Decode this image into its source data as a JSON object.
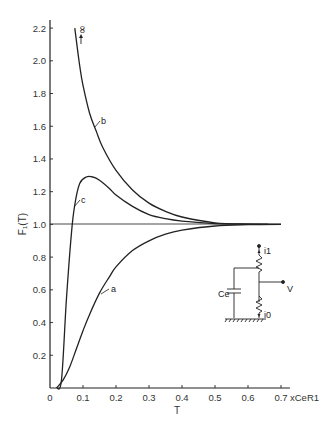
{
  "chart_data": {
    "type": "line",
    "title": "",
    "xlabel": "T",
    "x_unit_label": "x C_e R_1",
    "ylabel": "F₁(T)",
    "xlim": [
      0,
      0.75
    ],
    "ylim": [
      0,
      2.25
    ],
    "x_ticks": [
      "0",
      "0.1",
      "0.2",
      "0.3",
      "0.4",
      "0.5",
      "0.6",
      "0.7"
    ],
    "y_ticks": [
      "0.2",
      "0.4",
      "0.6",
      "0.8",
      "1.0",
      "1.2",
      "1.4",
      "1.6",
      "1.8",
      "2.0",
      "2.2"
    ],
    "grid": false,
    "reference_line": {
      "y": 1.0,
      "label": ""
    },
    "series": [
      {
        "name": "a",
        "x": [
          0.02,
          0.04,
          0.06,
          0.08,
          0.1,
          0.12,
          0.15,
          0.18,
          0.2,
          0.25,
          0.3,
          0.35,
          0.4,
          0.5,
          0.6,
          0.7
        ],
        "y": [
          0.0,
          0.05,
          0.13,
          0.24,
          0.35,
          0.45,
          0.58,
          0.68,
          0.74,
          0.84,
          0.9,
          0.94,
          0.965,
          0.99,
          0.998,
          1.0
        ]
      },
      {
        "name": "b",
        "x": [
          0.075,
          0.09,
          0.1,
          0.12,
          0.14,
          0.16,
          0.2,
          0.25,
          0.3,
          0.35,
          0.4,
          0.5,
          0.6,
          0.7
        ],
        "y": [
          2.2,
          1.97,
          1.85,
          1.68,
          1.57,
          1.47,
          1.33,
          1.21,
          1.13,
          1.08,
          1.045,
          1.01,
          1.002,
          1.0
        ]
      },
      {
        "name": "c",
        "x": [
          0.02,
          0.035,
          0.05,
          0.065,
          0.075,
          0.09,
          0.11,
          0.13,
          0.15,
          0.18,
          0.2,
          0.25,
          0.3,
          0.35,
          0.4,
          0.5,
          0.6,
          0.7
        ],
        "y": [
          0.0,
          0.05,
          0.55,
          0.95,
          1.12,
          1.25,
          1.29,
          1.29,
          1.27,
          1.22,
          1.18,
          1.11,
          1.06,
          1.035,
          1.02,
          1.005,
          1.001,
          1.0
        ]
      }
    ],
    "annotations": [
      {
        "text": "∞",
        "near_series": "b",
        "note": "arrow pointing up at top of curve b"
      },
      {
        "text": "a",
        "series": "a"
      },
      {
        "text": "b",
        "series": "b"
      },
      {
        "text": "c",
        "series": "c"
      }
    ],
    "inset_circuit": {
      "labels": [
        "i1",
        "Ce",
        "V",
        "i0"
      ],
      "description": "Two resistors in series between i1 and i0; capacitor Ce from upper node to ground; output V at middle node"
    }
  },
  "labels": {
    "x_axis_title": "T",
    "x_axis_unit": "xCeR1",
    "y_axis_title": "F₁(T)",
    "infinity": "∞",
    "curve_a": "a",
    "curve_b": "b",
    "curve_c": "c",
    "circuit_i1": "i1",
    "circuit_i0": "i0",
    "circuit_v": "V",
    "circuit_ce": "Ce"
  }
}
